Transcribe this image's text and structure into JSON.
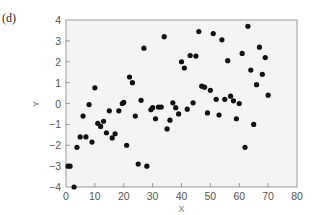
{
  "panel_label": "(d)",
  "chart_data": {
    "type": "scatter",
    "title": "",
    "xlabel": "X",
    "ylabel": "Y",
    "xlim": [
      0,
      80
    ],
    "ylim": [
      -4,
      4
    ],
    "xticks": [
      0,
      10,
      20,
      30,
      40,
      50,
      60,
      70,
      80
    ],
    "yticks": [
      -4,
      -3,
      -2,
      -1,
      0,
      1,
      2,
      3,
      4
    ],
    "grid": false,
    "legend": null,
    "colors": {
      "background": "#f4f4f4",
      "marker": "#111111",
      "axis": "#888888"
    },
    "points": [
      [
        0.7,
        -3.0
      ],
      [
        1.4,
        -3.0
      ],
      [
        2.8,
        -4.0
      ],
      [
        3.8,
        -2.1
      ],
      [
        4.9,
        -1.6
      ],
      [
        5.9,
        -0.6
      ],
      [
        6.9,
        -1.6
      ],
      [
        8.0,
        -0.05
      ],
      [
        9.0,
        -1.85
      ],
      [
        10.0,
        0.75
      ],
      [
        11.0,
        -0.95
      ],
      [
        12.0,
        -1.1
      ],
      [
        13.0,
        -0.85
      ],
      [
        14.0,
        -1.4
      ],
      [
        15.0,
        -0.35
      ],
      [
        16.0,
        -1.65
      ],
      [
        17.0,
        -1.45
      ],
      [
        18.3,
        -0.35
      ],
      [
        19.5,
        0.0
      ],
      [
        20.0,
        0.05
      ],
      [
        21.0,
        -2.0
      ],
      [
        22.0,
        1.27
      ],
      [
        23.0,
        1.0
      ],
      [
        24.0,
        -0.6
      ],
      [
        25.0,
        -2.9
      ],
      [
        26.0,
        0.15
      ],
      [
        27.0,
        2.65
      ],
      [
        28.0,
        -3.0
      ],
      [
        29.4,
        -0.3
      ],
      [
        30.0,
        -0.2
      ],
      [
        31.0,
        -0.73
      ],
      [
        32.0,
        -0.17
      ],
      [
        33.0,
        -0.17
      ],
      [
        34.0,
        3.2
      ],
      [
        35.0,
        -1.22
      ],
      [
        36.0,
        -0.8
      ],
      [
        37.0,
        0.03
      ],
      [
        38.0,
        -0.2
      ],
      [
        39.0,
        -0.5
      ],
      [
        40.0,
        2.0
      ],
      [
        41.0,
        1.7
      ],
      [
        42.0,
        -0.27
      ],
      [
        43.0,
        2.3
      ],
      [
        44.0,
        0.03
      ],
      [
        45.0,
        2.27
      ],
      [
        46.0,
        3.45
      ],
      [
        47.0,
        0.83
      ],
      [
        48.0,
        0.78
      ],
      [
        49.0,
        -0.45
      ],
      [
        50.0,
        0.63
      ],
      [
        51.0,
        3.35
      ],
      [
        52.0,
        0.2
      ],
      [
        53.0,
        -0.55
      ],
      [
        54.0,
        3.05
      ],
      [
        55.0,
        0.2
      ],
      [
        56.0,
        2.05
      ],
      [
        57.0,
        0.35
      ],
      [
        58.0,
        0.13
      ],
      [
        59.0,
        -0.73
      ],
      [
        60.0,
        0.0
      ],
      [
        61.0,
        2.4
      ],
      [
        62.0,
        -2.1
      ],
      [
        63.0,
        3.7
      ],
      [
        64.0,
        1.6
      ],
      [
        65.0,
        -1.0
      ],
      [
        66.0,
        0.9
      ],
      [
        67.0,
        2.7
      ],
      [
        68.0,
        1.4
      ],
      [
        69.0,
        2.2
      ],
      [
        70.0,
        0.4
      ]
    ]
  }
}
